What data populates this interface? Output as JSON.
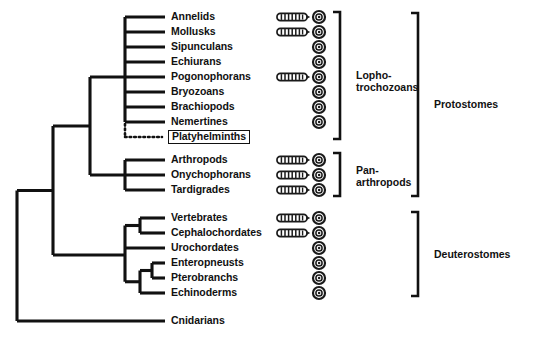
{
  "figure": {
    "type": "cladogram"
  },
  "taxa": [
    {
      "id": "annelids",
      "label": "Annelids",
      "y": 17,
      "worm": true,
      "circle": true,
      "boxed": false
    },
    {
      "id": "mollusks",
      "label": "Mollusks",
      "y": 32,
      "worm": true,
      "circle": true,
      "boxed": false
    },
    {
      "id": "sipunculans",
      "label": "Sipunculans",
      "y": 47,
      "worm": false,
      "circle": true,
      "boxed": false
    },
    {
      "id": "echiurans",
      "label": "Echiurans",
      "y": 62,
      "worm": false,
      "circle": true,
      "boxed": false
    },
    {
      "id": "pogonophorans",
      "label": "Pogonophorans",
      "y": 77,
      "worm": true,
      "circle": true,
      "boxed": false
    },
    {
      "id": "bryozoans",
      "label": "Bryozoans",
      "y": 92,
      "worm": false,
      "circle": true,
      "boxed": false
    },
    {
      "id": "brachiopods",
      "label": "Brachiopods",
      "y": 107,
      "worm": false,
      "circle": true,
      "boxed": false
    },
    {
      "id": "nemertines",
      "label": "Nemertines",
      "y": 122,
      "worm": false,
      "circle": true,
      "boxed": false
    },
    {
      "id": "platyhelminths",
      "label": "Platyhelminths",
      "y": 137,
      "worm": false,
      "circle": false,
      "boxed": true
    },
    {
      "id": "arthropods",
      "label": "Arthropods",
      "y": 160,
      "worm": true,
      "circle": true,
      "boxed": false
    },
    {
      "id": "onychophorans",
      "label": "Onychophorans",
      "y": 175,
      "worm": true,
      "circle": true,
      "boxed": false
    },
    {
      "id": "tardigrades",
      "label": "Tardigrades",
      "y": 190,
      "worm": true,
      "circle": true,
      "boxed": false
    },
    {
      "id": "vertebrates",
      "label": "Vertebrates",
      "y": 218,
      "worm": true,
      "circle": true,
      "boxed": false
    },
    {
      "id": "cephalochordates",
      "label": "Cephalochordates",
      "y": 233,
      "worm": true,
      "circle": true,
      "boxed": false
    },
    {
      "id": "urochordates",
      "label": "Urochordates",
      "y": 248,
      "worm": false,
      "circle": true,
      "boxed": false
    },
    {
      "id": "enteropneusts",
      "label": "Enteropneusts",
      "y": 263,
      "worm": false,
      "circle": true,
      "boxed": false
    },
    {
      "id": "pterobranchs",
      "label": "Pterobranchs",
      "y": 278,
      "worm": false,
      "circle": true,
      "boxed": false
    },
    {
      "id": "echinoderms",
      "label": "Echinoderms",
      "y": 293,
      "worm": false,
      "circle": true,
      "boxed": false
    },
    {
      "id": "cnidarians",
      "label": "Cnidarians",
      "y": 321,
      "worm": false,
      "circle": false,
      "boxed": false
    }
  ],
  "groups": [
    {
      "id": "lophotrochozoans",
      "label_line1": "Lopho-",
      "label_line2": "trochozoans",
      "bracket_x": 340,
      "bracket_top": 12,
      "bracket_bottom": 139,
      "label_x": 356,
      "label_y": 69
    },
    {
      "id": "panarthropods",
      "label_line1": "Pan-",
      "label_line2": "arthropods",
      "bracket_x": 340,
      "bracket_top": 153,
      "bracket_bottom": 196,
      "label_x": 356,
      "label_y": 164
    },
    {
      "id": "protostomes",
      "label_line1": "Protostomes",
      "label_line2": "",
      "bracket_x": 418,
      "bracket_top": 13,
      "bracket_bottom": 196,
      "label_x": 434,
      "label_y": 98
    },
    {
      "id": "deuterostomes",
      "label_line1": "Deuterostomes",
      "label_line2": "",
      "bracket_x": 418,
      "bracket_top": 212,
      "bracket_bottom": 296,
      "label_x": 434,
      "label_y": 248
    }
  ],
  "symbols": {
    "worm_name": "segmented-worm-icon",
    "circle_name": "spiral-cleavage-icon",
    "worm_x": 277,
    "circle_x": 312
  },
  "colors": {
    "ink": "#111111",
    "background": "#ffffff"
  },
  "tree": {
    "root_x": 17,
    "tip_x": 165,
    "nodes": [
      {
        "id": "root",
        "x": 17,
        "label": "animal-root"
      },
      {
        "id": "bilateria",
        "x": 53,
        "label": "bilateria-node"
      },
      {
        "id": "protostome-node",
        "x": 90,
        "label": "protostome-node"
      },
      {
        "id": "lopho-node",
        "x": 125,
        "label": "lophotrochozoan-node"
      },
      {
        "id": "panarth-node",
        "x": 125,
        "label": "panarthropod-node"
      },
      {
        "id": "deutero-node",
        "x": 125,
        "label": "deuterostome-node"
      },
      {
        "id": "chordate-node",
        "x": 140,
        "label": "chordate-node"
      },
      {
        "id": "ambulacr-node",
        "x": 140,
        "label": "ambulacraria-node"
      }
    ]
  }
}
